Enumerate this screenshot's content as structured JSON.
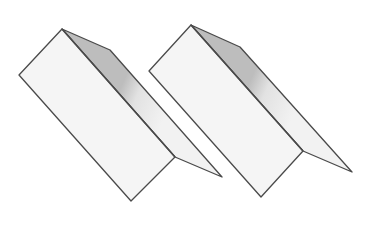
{
  "figure": {
    "colors": {
      "background": "#ffffff",
      "face": "#f5f5f5",
      "back_face": "#f2f2f2",
      "shadow": "#bdbdbd",
      "outline": "#4a4a4a"
    },
    "shapes": [
      {
        "name": "left-folded-sheet",
        "top": [
          62,
          29
        ],
        "left": [
          19,
          75
        ],
        "bottom": [
          131,
          201
        ],
        "fold_end": [
          175,
          157
        ],
        "back_top": [
          110,
          50
        ],
        "back_tip": [
          222,
          177
        ]
      },
      {
        "name": "right-folded-sheet",
        "top": [
          191,
          25
        ],
        "left": [
          149,
          71
        ],
        "bottom": [
          261,
          197
        ],
        "fold_end": [
          303,
          151
        ],
        "back_top": [
          240,
          47
        ],
        "back_tip": [
          352,
          172
        ]
      }
    ]
  }
}
